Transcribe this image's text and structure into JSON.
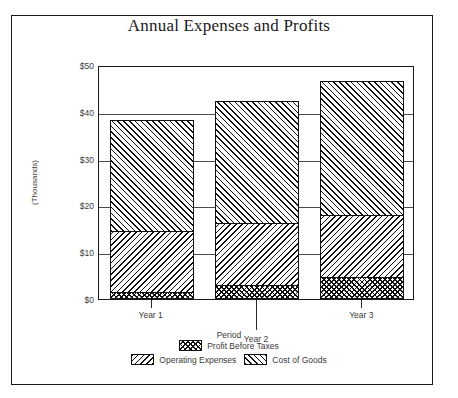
{
  "chart_data": {
    "type": "bar",
    "subtype": "stacked",
    "title": "Annual Expenses and Profits",
    "xlabel": "Period",
    "ylabel": "(Thousands)",
    "categories": [
      "Year 1",
      "Year 2",
      "Year 3"
    ],
    "ylim": [
      0,
      50
    ],
    "yticks": [
      0,
      10,
      20,
      30,
      40,
      50
    ],
    "ytick_labels": [
      "$0",
      "$10",
      "$20",
      "$30",
      "$40",
      "$50"
    ],
    "grid": true,
    "legend_position": "bottom",
    "series": [
      {
        "name": "Profit Before Taxes",
        "pattern": "crosshatch",
        "values": [
          1.0,
          2.5,
          4.3
        ]
      },
      {
        "name": "Operating Expenses",
        "pattern": "backslash-hatch",
        "values": [
          13.3,
          13.5,
          13.4
        ]
      },
      {
        "name": "Cost of Goods",
        "pattern": "forwardslash-hatch",
        "values": [
          24.0,
          26.3,
          28.8
        ]
      }
    ],
    "totals": [
      38.3,
      42.3,
      46.5
    ],
    "colors": {
      "ink": "#111111",
      "axis": "#1a1a1a",
      "text": "#3a3a3a",
      "background": "#ffffff"
    }
  },
  "legend": {
    "rows": [
      [
        {
          "label": "Profit Before Taxes",
          "series_index": 0
        }
      ],
      [
        {
          "label": "Operating Expenses",
          "series_index": 1
        },
        {
          "label": "Cost of Goods",
          "series_index": 2
        }
      ]
    ]
  }
}
